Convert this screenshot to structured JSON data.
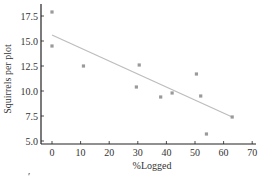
{
  "chart_data": {
    "type": "scatter",
    "title": "",
    "xlabel": "%Logged",
    "ylabel": "Squirrels per plot",
    "xlim": [
      -3,
      71
    ],
    "ylim": [
      5.0,
      19.0
    ],
    "xticks": [
      0,
      10,
      20,
      30,
      40,
      50,
      60,
      70
    ],
    "yticks": [
      5.0,
      7.5,
      10.0,
      12.5,
      15.0,
      17.5
    ],
    "xtick_labels": [
      "0",
      "10",
      "20",
      "30",
      "40",
      "50",
      "60",
      "70"
    ],
    "ytick_labels": [
      "5.0",
      "7.5",
      "10.0",
      "12.5",
      "15.0",
      "17.5"
    ],
    "grid": false,
    "legend": null,
    "points": [
      {
        "x": 0,
        "y": 17.9
      },
      {
        "x": 0,
        "y": 14.5
      },
      {
        "x": 11,
        "y": 12.5
      },
      {
        "x": 30.5,
        "y": 12.6
      },
      {
        "x": 29.5,
        "y": 10.4
      },
      {
        "x": 38,
        "y": 9.4
      },
      {
        "x": 42,
        "y": 9.8
      },
      {
        "x": 50.5,
        "y": 11.7
      },
      {
        "x": 52,
        "y": 9.5
      },
      {
        "x": 54,
        "y": 5.7
      },
      {
        "x": 63,
        "y": 7.4
      }
    ],
    "regression_line": {
      "x": [
        0,
        63
      ],
      "y": [
        15.6,
        7.4
      ]
    },
    "colors": {
      "points": "#9a9a9a",
      "line": "#bdbdbd",
      "axis": "#222222"
    }
  }
}
